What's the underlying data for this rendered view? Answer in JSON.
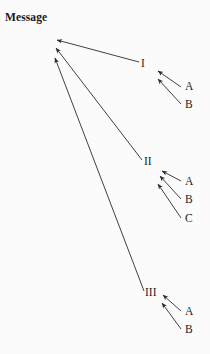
{
  "title": "Message",
  "diagram": {
    "type": "arrow-tree",
    "background_color": "#fbfbfb",
    "stroke_color": "#2b2b2b",
    "root": {
      "name": "message-root",
      "converge_points": [
        {
          "x": 56,
          "y": 40
        },
        {
          "x": 55,
          "y": 48
        },
        {
          "x": 54,
          "y": 58
        }
      ]
    },
    "branches": [
      {
        "label": "I",
        "label_x": 141,
        "label_y": 58,
        "tail": {
          "x": 139,
          "y": 62
        },
        "head": {
          "x": 57,
          "y": 40
        },
        "children": [
          {
            "label": "A",
            "label_x": 185,
            "label_y": 81,
            "tail": {
              "x": 181,
              "y": 87
            },
            "head": {
              "x": 158,
              "y": 71
            }
          },
          {
            "label": "B",
            "label_x": 185,
            "label_y": 99,
            "tail": {
              "x": 181,
              "y": 104
            },
            "head": {
              "x": 158,
              "y": 79
            }
          }
        ]
      },
      {
        "label": "II",
        "label_x": 144,
        "label_y": 156,
        "tail": {
          "x": 142,
          "y": 160
        },
        "head": {
          "x": 56,
          "y": 48
        },
        "children": [
          {
            "label": "A",
            "label_x": 185,
            "label_y": 176,
            "tail": {
              "x": 181,
              "y": 181
            },
            "head": {
              "x": 162,
              "y": 171
            }
          },
          {
            "label": "B",
            "label_x": 185,
            "label_y": 194,
            "tail": {
              "x": 181,
              "y": 199
            },
            "head": {
              "x": 160,
              "y": 176
            }
          },
          {
            "label": "C",
            "label_x": 185,
            "label_y": 213,
            "tail": {
              "x": 181,
              "y": 218
            },
            "head": {
              "x": 158,
              "y": 184
            }
          }
        ]
      },
      {
        "label": "III",
        "label_x": 145,
        "label_y": 287,
        "tail": {
          "x": 144,
          "y": 291
        },
        "head": {
          "x": 55,
          "y": 58
        },
        "children": [
          {
            "label": "A",
            "label_x": 185,
            "label_y": 306,
            "tail": {
              "x": 181,
              "y": 311
            },
            "head": {
              "x": 163,
              "y": 295
            }
          },
          {
            "label": "B",
            "label_x": 185,
            "label_y": 324,
            "tail": {
              "x": 181,
              "y": 329
            },
            "head": {
              "x": 162,
              "y": 303
            }
          }
        ]
      }
    ]
  }
}
